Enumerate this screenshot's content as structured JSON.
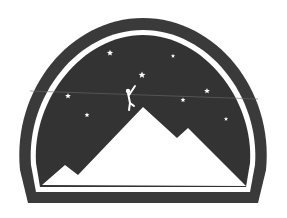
{
  "logo": {
    "description": "Dome-shaped emblem with starry night sky, mountain range and a climber reaching for a star",
    "colors": {
      "background": "#ffffff",
      "frame": "#3a3a3a",
      "sky": "#333333",
      "ring": "#ffffff",
      "mountains": "#ffffff",
      "stars": "#ffffff"
    },
    "stars": [
      {
        "x": 110,
        "y": 53,
        "r": 3.2
      },
      {
        "x": 173,
        "y": 56,
        "r": 2.2
      },
      {
        "x": 142,
        "y": 75,
        "r": 3.6
      },
      {
        "x": 68,
        "y": 96,
        "r": 3.0
      },
      {
        "x": 207,
        "y": 91,
        "r": 3.0
      },
      {
        "x": 183,
        "y": 100,
        "r": 2.6
      },
      {
        "x": 87,
        "y": 115,
        "r": 2.6
      },
      {
        "x": 226,
        "y": 119,
        "r": 2.2
      }
    ],
    "icons": [
      "mountain-icon",
      "star-icon",
      "climber-icon"
    ]
  }
}
